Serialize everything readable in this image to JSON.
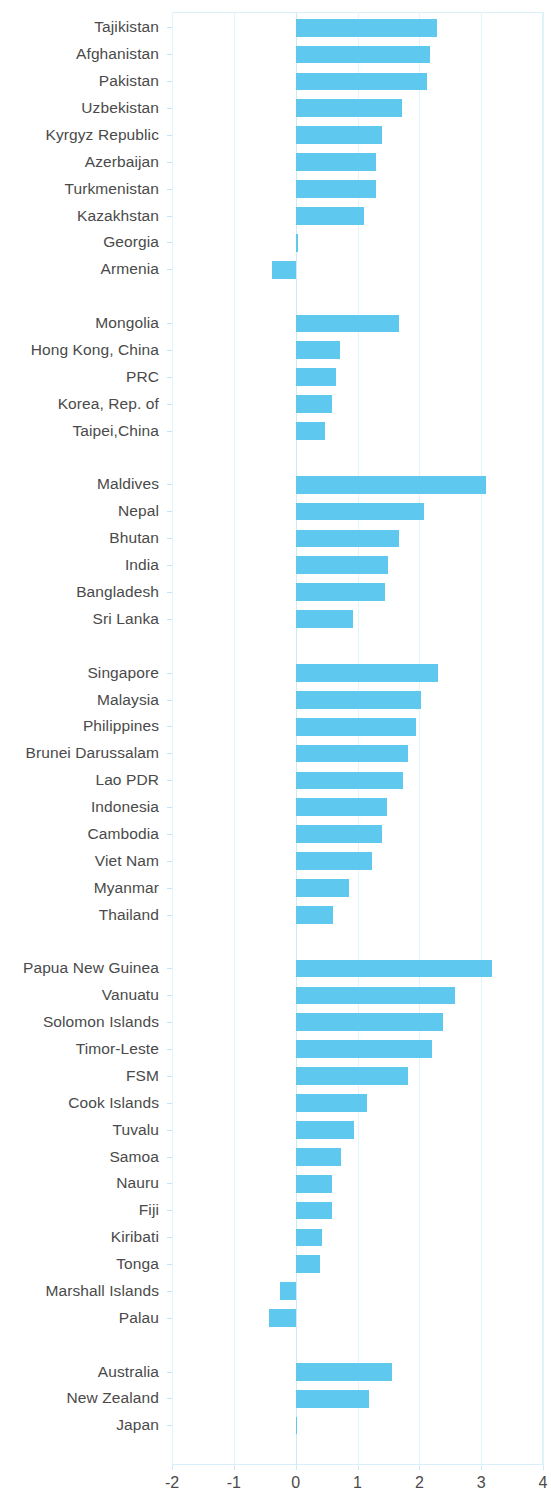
{
  "chart_data": {
    "type": "bar",
    "orientation": "horizontal",
    "title": "",
    "subtitle": "",
    "xlabel": "",
    "ylabel": "",
    "xlim": [
      -2,
      4
    ],
    "xticks": [
      -2,
      -1,
      0,
      1,
      2,
      3,
      4
    ],
    "xtick_labels": [
      "-2",
      "-1",
      "0",
      "1",
      "2",
      "3",
      "4"
    ],
    "grid": true,
    "legend": null,
    "bar_color": "#5ec8ee",
    "axis_color": "#d8f0f9",
    "text_color": "#4a4a4a",
    "groups": [
      {
        "name": "Central and West Asia",
        "items": [
          {
            "label": "Tajikistan",
            "value": 2.28
          },
          {
            "label": "Afghanistan",
            "value": 2.17
          },
          {
            "label": "Pakistan",
            "value": 2.12
          },
          {
            "label": "Uzbekistan",
            "value": 1.72
          },
          {
            "label": "Kyrgyz Republic",
            "value": 1.39
          },
          {
            "label": "Azerbaijan",
            "value": 1.3
          },
          {
            "label": "Turkmenistan",
            "value": 1.3
          },
          {
            "label": "Kazakhstan",
            "value": 1.1
          },
          {
            "label": "Georgia",
            "value": 0.03
          },
          {
            "label": "Armenia",
            "value": -0.39
          }
        ]
      },
      {
        "name": "East Asia",
        "items": [
          {
            "label": "Mongolia",
            "value": 1.67
          },
          {
            "label": "Hong Kong, China",
            "value": 0.71
          },
          {
            "label": "PRC",
            "value": 0.65
          },
          {
            "label": "Korea, Rep. of",
            "value": 0.58
          },
          {
            "label": "Taipei,China",
            "value": 0.47
          }
        ]
      },
      {
        "name": "South Asia",
        "items": [
          {
            "label": "Maldives",
            "value": 3.08
          },
          {
            "label": "Nepal",
            "value": 2.07
          },
          {
            "label": "Bhutan",
            "value": 1.67
          },
          {
            "label": "India",
            "value": 1.5
          },
          {
            "label": "Bangladesh",
            "value": 1.44
          },
          {
            "label": "Sri Lanka",
            "value": 0.92
          }
        ]
      },
      {
        "name": "Southeast Asia",
        "items": [
          {
            "label": "Singapore",
            "value": 2.3
          },
          {
            "label": "Malaysia",
            "value": 2.03
          },
          {
            "label": "Philippines",
            "value": 1.94
          },
          {
            "label": "Brunei Darussalam",
            "value": 1.81
          },
          {
            "label": "Lao PDR",
            "value": 1.73
          },
          {
            "label": "Indonesia",
            "value": 1.48
          },
          {
            "label": "Cambodia",
            "value": 1.4
          },
          {
            "label": "Viet Nam",
            "value": 1.24
          },
          {
            "label": "Myanmar",
            "value": 0.87
          },
          {
            "label": "Thailand",
            "value": 0.61
          }
        ]
      },
      {
        "name": "The Pacific",
        "items": [
          {
            "label": "Papua New Guinea",
            "value": 3.18
          },
          {
            "label": "Vanuatu",
            "value": 2.57
          },
          {
            "label": "Solomon Islands",
            "value": 2.38
          },
          {
            "label": "Timor-Leste",
            "value": 2.21
          },
          {
            "label": "FSM",
            "value": 1.81
          },
          {
            "label": "Cook Islands",
            "value": 1.16
          },
          {
            "label": "Tuvalu",
            "value": 0.94
          },
          {
            "label": "Samoa",
            "value": 0.74
          },
          {
            "label": "Nauru",
            "value": 0.59
          },
          {
            "label": "Fiji",
            "value": 0.59
          },
          {
            "label": "Kiribati",
            "value": 0.42
          },
          {
            "label": "Tonga",
            "value": 0.39
          },
          {
            "label": "Marshall Islands",
            "value": -0.26
          },
          {
            "label": "Palau",
            "value": -0.43
          }
        ]
      },
      {
        "name": "Developed Member Economies",
        "items": [
          {
            "label": "Australia",
            "value": 1.56
          },
          {
            "label": "New Zealand",
            "value": 1.19
          },
          {
            "label": "Japan",
            "value": 0.02
          }
        ]
      }
    ]
  }
}
